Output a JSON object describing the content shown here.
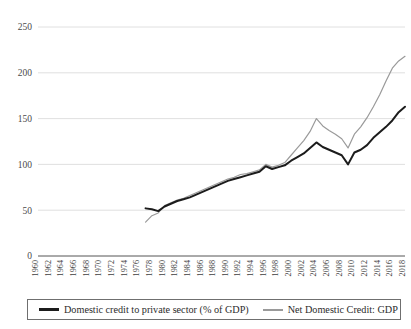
{
  "chart_data": {
    "type": "line",
    "title": "",
    "xlabel": "",
    "ylabel": "",
    "grid": true,
    "legend_position": "bottom",
    "ylim": [
      0,
      250
    ],
    "yticks": [
      0,
      50,
      100,
      150,
      200,
      250
    ],
    "xlim": [
      1960,
      2018
    ],
    "xticks": [
      1960,
      1962,
      1964,
      1966,
      1968,
      1970,
      1972,
      1974,
      1976,
      1978,
      1980,
      1982,
      1984,
      1986,
      1988,
      1990,
      1992,
      1994,
      1996,
      1998,
      2000,
      2002,
      2004,
      2006,
      2008,
      2010,
      2012,
      2014,
      2016,
      2018
    ],
    "colors": {
      "private_credit": "#1c1c1c",
      "net_domestic_credit": "#9a9a9a",
      "gridline": "#d8d8d8",
      "axis": "#555555"
    },
    "series": [
      {
        "name": "Domestic credit to private sector (% of GDP)",
        "color": "#1c1c1c",
        "x": [
          1977,
          1978,
          1979,
          1980,
          1981,
          1982,
          1983,
          1984,
          1985,
          1986,
          1987,
          1988,
          1989,
          1990,
          1991,
          1992,
          1993,
          1994,
          1995,
          1996,
          1997,
          1998,
          1999,
          2000,
          2001,
          2002,
          2003,
          2004,
          2005,
          2006,
          2007,
          2008,
          2009,
          2010,
          2011,
          2012,
          2013,
          2014,
          2015,
          2016,
          2017,
          2018
        ],
        "values": [
          52,
          51,
          49,
          54,
          57,
          60,
          62,
          64,
          67,
          70,
          73,
          76,
          79,
          82,
          84,
          86,
          88,
          90,
          92,
          98,
          95,
          97,
          99,
          104,
          108,
          112,
          118,
          124,
          119,
          116,
          113,
          110,
          100,
          113,
          116,
          121,
          129,
          135,
          141,
          148,
          157,
          163
        ]
      },
      {
        "name": "Net Domestic Credit: GDP",
        "color": "#9a9a9a",
        "x": [
          1977,
          1978,
          1979,
          1980,
          1981,
          1982,
          1983,
          1984,
          1985,
          1986,
          1987,
          1988,
          1989,
          1990,
          1991,
          1992,
          1993,
          1994,
          1995,
          1996,
          1997,
          1998,
          1999,
          2000,
          2001,
          2002,
          2003,
          2004,
          2005,
          2006,
          2007,
          2008,
          2009,
          2010,
          2011,
          2012,
          2013,
          2014,
          2015,
          2016,
          2017,
          2018
        ],
        "values": [
          37,
          44,
          47,
          55,
          58,
          61,
          63,
          66,
          69,
          72,
          75,
          78,
          81,
          84,
          86,
          89,
          90,
          92,
          94,
          100,
          97,
          99,
          102,
          110,
          118,
          126,
          136,
          150,
          142,
          137,
          133,
          128,
          118,
          133,
          141,
          151,
          163,
          176,
          191,
          205,
          213,
          218
        ]
      }
    ]
  },
  "legend": {
    "entries": [
      {
        "label": "Domestic credit to private sector (% of GDP)",
        "style": "dark"
      },
      {
        "label": "Net Domestic Credit: GDP",
        "style": "grey"
      }
    ]
  }
}
